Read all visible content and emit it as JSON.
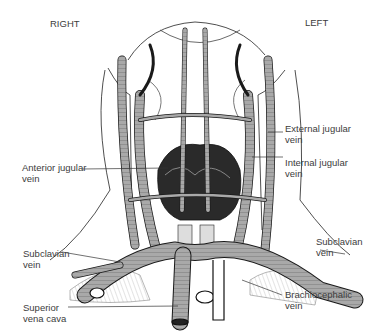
{
  "orientation": {
    "right": "RIGHT",
    "left": "LEFT"
  },
  "labels": {
    "external_jugular": {
      "line1": "External jugular",
      "line2": "vein"
    },
    "internal_jugular": {
      "line1": "Internal jugular",
      "line2": "vein"
    },
    "anterior_jugular": {
      "line1": "Anterior jugular",
      "line2": "vein"
    },
    "subclavian_right": {
      "line1": "Subclavian",
      "line2": "vein"
    },
    "subclavian_left": {
      "line1": "Subclavian",
      "line2": "vein"
    },
    "superior_vena_cava": {
      "line1": "Superior",
      "line2": "vena cava"
    },
    "brachiocephalic": {
      "line1": "Brachiocephalic",
      "line2": "vein"
    }
  },
  "colors": {
    "vein_fill": "#a9a9a9",
    "outline": "#1a1a1a",
    "gland": "#222222",
    "text": "#3c3c3c"
  }
}
